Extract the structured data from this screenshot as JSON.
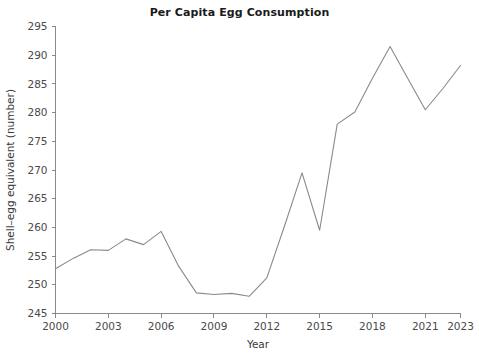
{
  "chart_data": {
    "type": "line",
    "title": "Per Capita Egg Consumption",
    "xlabel": "Year",
    "ylabel": "Shell–egg equivalent (number)",
    "x": [
      2000,
      2001,
      2002,
      2003,
      2004,
      2005,
      2006,
      2007,
      2008,
      2009,
      2010,
      2011,
      2012,
      2013,
      2014,
      2015,
      2016,
      2017,
      2018,
      2019,
      2020,
      2021,
      2022,
      2023
    ],
    "values": [
      252.8,
      254.6,
      256.1,
      256.0,
      258.0,
      257.0,
      259.3,
      253.2,
      248.6,
      248.3,
      248.5,
      248.0,
      251.2,
      260.2,
      269.5,
      259.5,
      278.0,
      280.1,
      286.0,
      291.5,
      286.0,
      280.5,
      284.2,
      288.2
    ],
    "series": [
      {
        "name": "Shell-egg equivalent (number)",
        "values": [
          252.8,
          254.6,
          256.1,
          256.0,
          258.0,
          257.0,
          259.3,
          253.2,
          248.6,
          248.3,
          248.5,
          248.0,
          251.2,
          260.2,
          269.5,
          259.5,
          278.0,
          280.1,
          286.0,
          291.5,
          286.0,
          280.5,
          284.2,
          288.2
        ]
      }
    ],
    "xlim": [
      2000,
      2023
    ],
    "ylim": [
      245,
      295
    ],
    "x_ticks": [
      2000,
      2003,
      2006,
      2009,
      2012,
      2015,
      2018,
      2021,
      2023
    ],
    "x_tick_labels": [
      "2000",
      "2003",
      "2006",
      "2009",
      "2012",
      "2015",
      "2018",
      "2021",
      "2023"
    ],
    "y_ticks": [
      245,
      250,
      255,
      260,
      265,
      270,
      275,
      280,
      285,
      290,
      295
    ],
    "y_tick_labels": [
      "245",
      "250",
      "255",
      "260",
      "265",
      "270",
      "275",
      "280",
      "285",
      "290",
      "295"
    ],
    "grid": false,
    "legend": false,
    "line_color": "#8a8a8a",
    "axis_color": "#7d7d7d",
    "text_color": "#3a3a3a",
    "background_color": "#ffffff"
  }
}
